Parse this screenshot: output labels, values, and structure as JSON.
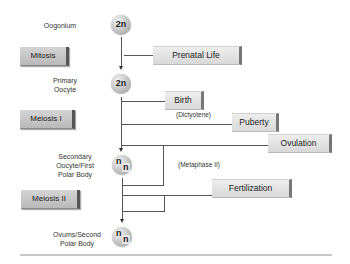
{
  "cells": [
    {
      "label": "Oogonium",
      "ploidy": "2n"
    },
    {
      "label_lines": [
        "Primary",
        "Oocyte"
      ],
      "ploidy": "2n"
    },
    {
      "label_lines": [
        "Secondary",
        "Oocyte/First",
        "Polar Body"
      ],
      "ploidy": "n",
      "ploidy2": "n"
    },
    {
      "label_lines": [
        "Ovums/Second",
        "Polar Body"
      ],
      "ploidy": "n",
      "ploidy2": "n"
    }
  ],
  "phases": [
    "Mitosis",
    "Meiosis I",
    "Meiosis II"
  ],
  "events": [
    "Prenatal Life",
    "Birth",
    "Puberty",
    "Ovulation",
    "Fertilization"
  ],
  "annotations": [
    "(Dictyotene)",
    "(Metaphase II)"
  ],
  "colors": {
    "line": "#555555",
    "phase_box": "#c4c4c4",
    "event_box": "#e6e6e6"
  }
}
